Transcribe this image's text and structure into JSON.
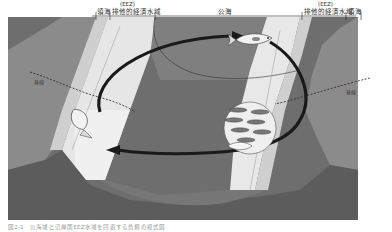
{
  "figure": {
    "top_labels": {
      "left_eez_tag": "(EEZ)",
      "left_territorial_sea": "領海",
      "left_eez": "排他的経済水域",
      "high_seas": "公海",
      "right_eez_tag": "(EEZ)",
      "right_eez": "排他的経済水域",
      "right_territorial_sea": "領海"
    },
    "baseline_labels": {
      "left": "基線",
      "right": "基線"
    },
    "caption": "図2-1　公海域と沿岸国EEZ水域を回遊する魚類の模式図",
    "colors": {
      "land": "#8a8a8a",
      "deep_sea": "#7c7c7c",
      "territorial_sea": "#d6d6d6",
      "eez": "#e9e9e9",
      "arrow": "#1a1a1a"
    },
    "icons": [
      "fish-icon",
      "fish-school-icon",
      "migration-arrow-icon"
    ]
  }
}
